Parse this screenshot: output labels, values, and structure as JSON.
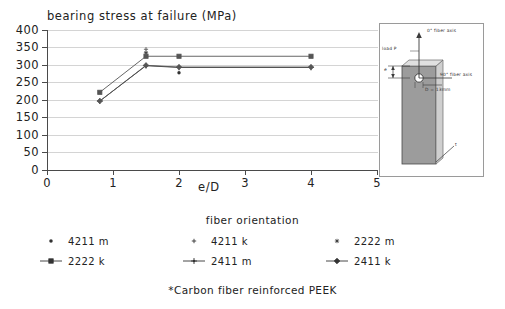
{
  "chart_data": {
    "type": "line",
    "title": "bearing stress at failure (MPa)",
    "xlabel": "e/D",
    "ylabel": "bearing stress at failure (MPa)",
    "xlim": [
      0,
      5
    ],
    "ylim": [
      0,
      400
    ],
    "xticks": [
      "0",
      "1",
      "2",
      "3",
      "4",
      "5"
    ],
    "yticks": [
      "0",
      "50",
      "100",
      "150",
      "200",
      "250",
      "300",
      "350",
      "400"
    ],
    "grid": true,
    "legend_position": "below",
    "legend_title": "fiber orientation",
    "footnote": "*Carbon fiber reinforced PEEK",
    "x": [
      0.8,
      1.5,
      2.0,
      4.0
    ],
    "series": [
      {
        "name": "4211 m",
        "marker": "dot",
        "line": false,
        "values": [
          null,
          null,
          278,
          null
        ]
      },
      {
        "name": "4211 k",
        "marker": "plus",
        "line": false,
        "values": [
          null,
          345,
          null,
          null
        ]
      },
      {
        "name": "2222 m",
        "marker": "asterisk",
        "line": false,
        "values": [
          null,
          335,
          null,
          null
        ]
      },
      {
        "name": "2222 k",
        "marker": "square",
        "line": true,
        "values": [
          222,
          325,
          325,
          325
        ]
      },
      {
        "name": "2411 m",
        "marker": "cross",
        "line": true,
        "values": [
          197,
          298,
          293,
          293
        ]
      },
      {
        "name": "2411 k",
        "marker": "diamond",
        "line": true,
        "values": [
          197,
          299,
          294,
          294
        ]
      }
    ]
  },
  "chart": {
    "title": "bearing stress at failure (MPa)",
    "x_axis_caption": "e/D",
    "x_tick_labels": [
      "0",
      "1",
      "2",
      "3",
      "4",
      "5"
    ],
    "y_tick_labels": [
      "400",
      "350",
      "300",
      "250",
      "200",
      "150",
      "100",
      "50",
      "0"
    ]
  },
  "legend": {
    "title": "fiber orientation",
    "rows": [
      [
        {
          "label": "4211 m",
          "marker": "dot",
          "has_line": false
        },
        {
          "label": "4211 k",
          "marker": "plus",
          "has_line": false
        },
        {
          "label": "2222 m",
          "marker": "asterisk",
          "has_line": false
        }
      ],
      [
        {
          "label": "2222 k",
          "marker": "square",
          "has_line": true
        },
        {
          "label": "2411 m",
          "marker": "cross",
          "has_line": true
        },
        {
          "label": "2411 k",
          "marker": "diamond",
          "has_line": true
        }
      ]
    ]
  },
  "footnote": "*Carbon fiber reinforced PEEK",
  "inset": {
    "load_label": "load P",
    "fiber_axis_0": "0° fiber axis",
    "fiber_axis_90": "90° fiber axis",
    "diameter_label": "D = 13mm",
    "edge_distance_label": "e",
    "thickness_label": "t"
  },
  "colors": {
    "axis": "#4a4a4a",
    "grid": "#d4d4d4",
    "series_dark": "#333333",
    "series_mid": "#555555",
    "specimen_fill": "#9c9c9c",
    "background": "#ffffff"
  }
}
